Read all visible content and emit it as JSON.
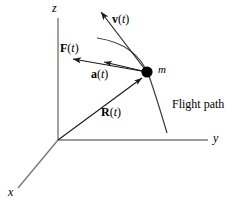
{
  "figure": {
    "axes": {
      "z_label": "z",
      "y_label": "y",
      "x_label": "x",
      "origin": [
        58,
        140
      ],
      "z_tip": [
        58,
        18
      ],
      "y_tip": [
        208,
        140
      ],
      "x_tip": [
        18,
        188
      ]
    },
    "particle": {
      "mass_label": "m",
      "center": [
        147,
        72
      ],
      "radius": 5.5,
      "color": "#000000"
    },
    "vectors": [
      {
        "name": "velocity",
        "label_bold": "v",
        "label_paren_open": "(",
        "label_italic": "t",
        "label_paren_close": ")",
        "from": [
          147,
          72
        ],
        "to": [
          100,
          11
        ]
      },
      {
        "name": "force",
        "label_bold": "F",
        "label_paren_open": "(",
        "label_italic": "t",
        "label_paren_close": ")",
        "from": [
          147,
          72
        ],
        "to": [
          72,
          59
        ]
      },
      {
        "name": "acceleration",
        "label_bold": "a",
        "label_paren_open": "(",
        "label_italic": "t",
        "label_paren_close": ")",
        "from": [
          147,
          72
        ],
        "to": [
          100,
          61
        ]
      },
      {
        "name": "position",
        "label_bold": "R",
        "label_paren_open": "(",
        "label_italic": "t",
        "label_paren_close": ")",
        "from": [
          58,
          140
        ],
        "to": [
          142,
          78
        ]
      }
    ],
    "flight_path": {
      "label": "Flight path",
      "start": [
        97,
        38
      ],
      "end": [
        167,
        133
      ]
    },
    "colors": {
      "stroke": "#1a1a1a",
      "axis": "#707070",
      "text": "#000000",
      "background": "#ffffff"
    }
  }
}
